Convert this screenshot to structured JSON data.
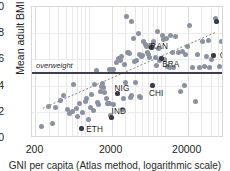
{
  "chart_data": {
    "type": "scatter",
    "title": "",
    "xlabel": "GNI per capita (Atlas method, logarithmic scale)",
    "ylabel": "Mean adult BMI",
    "xscale": "log",
    "xlim": [
      180,
      60000
    ],
    "ylim": [
      20,
      30
    ],
    "xticks": [
      200,
      2000,
      20000
    ],
    "xticklabels": [
      "200",
      "2000",
      "20000"
    ],
    "yticks": [
      20,
      22,
      24,
      26,
      28,
      30
    ],
    "yticklabels": [
      "20",
      "22",
      "24",
      "26",
      "28",
      "30"
    ],
    "grid": true,
    "legend": "none",
    "reference_lines": [
      {
        "name": "overweight",
        "label": "overweight",
        "orientation": "horizontal",
        "y": 25,
        "color": "#3d3d4d"
      }
    ],
    "trend_line": {
      "style": "dotted",
      "color": "#808080",
      "x_start": 250,
      "y_start": 22.15,
      "x_end": 50000,
      "y_end": 28.05
    },
    "labeled_points": [
      {
        "label": "USA",
        "x": 48000,
        "y": 28.9,
        "label_dx": 6,
        "label_dy": -7
      },
      {
        "label": "GER",
        "x": 44000,
        "y": 26.3,
        "label_dx": 6,
        "label_dy": -1
      },
      {
        "label": "IRAN",
        "x": 6600,
        "y": 26.9,
        "label_dx": -3,
        "label_dy": -2
      },
      {
        "label": "BRA",
        "x": 9000,
        "y": 26.1,
        "label_dx": 1,
        "label_dy": 6
      },
      {
        "label": "NIG",
        "x": 2400,
        "y": 23.4,
        "label_dx": -3,
        "label_dy": -6
      },
      {
        "label": "CHI",
        "x": 7000,
        "y": 24.0,
        "label_dx": -4,
        "label_dy": 7
      },
      {
        "label": "IND",
        "x": 2000,
        "y": 21.6,
        "label_dx": 0,
        "label_dy": -6
      },
      {
        "label": "ETH",
        "x": 800,
        "y": 20.7,
        "label_dx": 5,
        "label_dy": 0
      }
    ],
    "points": [
      {
        "x": 240,
        "y": 20.85
      },
      {
        "x": 330,
        "y": 21.1
      },
      {
        "x": 300,
        "y": 22.4
      },
      {
        "x": 370,
        "y": 22.35
      },
      {
        "x": 420,
        "y": 22.9
      },
      {
        "x": 470,
        "y": 23.25
      },
      {
        "x": 520,
        "y": 22.15
      },
      {
        "x": 560,
        "y": 21.9
      },
      {
        "x": 610,
        "y": 22.05
      },
      {
        "x": 640,
        "y": 24.1
      },
      {
        "x": 700,
        "y": 22.25
      },
      {
        "x": 720,
        "y": 21.65
      },
      {
        "x": 760,
        "y": 22.6
      },
      {
        "x": 800,
        "y": 20.7
      },
      {
        "x": 840,
        "y": 21.95
      },
      {
        "x": 900,
        "y": 22.8
      },
      {
        "x": 950,
        "y": 23.05
      },
      {
        "x": 980,
        "y": 21.45
      },
      {
        "x": 1050,
        "y": 22.35
      },
      {
        "x": 1100,
        "y": 23.35
      },
      {
        "x": 1150,
        "y": 22.1
      },
      {
        "x": 1200,
        "y": 24.05
      },
      {
        "x": 1250,
        "y": 25.15
      },
      {
        "x": 1300,
        "y": 22.7
      },
      {
        "x": 1350,
        "y": 22.55
      },
      {
        "x": 1420,
        "y": 23.55
      },
      {
        "x": 1500,
        "y": 24.15
      },
      {
        "x": 1550,
        "y": 23.85
      },
      {
        "x": 1600,
        "y": 23.45
      },
      {
        "x": 1700,
        "y": 23.05
      },
      {
        "x": 1750,
        "y": 22.65
      },
      {
        "x": 1800,
        "y": 22.6
      },
      {
        "x": 1900,
        "y": 22.6
      },
      {
        "x": 1950,
        "y": 21.7
      },
      {
        "x": 2000,
        "y": 21.6
      },
      {
        "x": 2100,
        "y": 22.55
      },
      {
        "x": 2150,
        "y": 25.25
      },
      {
        "x": 2300,
        "y": 25.8
      },
      {
        "x": 2400,
        "y": 23.4
      },
      {
        "x": 2500,
        "y": 26.05
      },
      {
        "x": 2600,
        "y": 25.95
      },
      {
        "x": 2700,
        "y": 26.2
      },
      {
        "x": 2800,
        "y": 22.15
      },
      {
        "x": 2900,
        "y": 23.05
      },
      {
        "x": 3000,
        "y": 25.6
      },
      {
        "x": 3100,
        "y": 29.25
      },
      {
        "x": 3200,
        "y": 26.5
      },
      {
        "x": 3300,
        "y": 26.55
      },
      {
        "x": 3400,
        "y": 26.45
      },
      {
        "x": 3500,
        "y": 23.1
      },
      {
        "x": 3600,
        "y": 23.25
      },
      {
        "x": 3700,
        "y": 28.9
      },
      {
        "x": 3900,
        "y": 27.6
      },
      {
        "x": 4000,
        "y": 25.85
      },
      {
        "x": 4100,
        "y": 24.2
      },
      {
        "x": 4300,
        "y": 25.9
      },
      {
        "x": 4500,
        "y": 27.95
      },
      {
        "x": 4700,
        "y": 26.4
      },
      {
        "x": 4900,
        "y": 26.25
      },
      {
        "x": 5100,
        "y": 26.3
      },
      {
        "x": 5300,
        "y": 27.35
      },
      {
        "x": 5500,
        "y": 27.1
      },
      {
        "x": 5700,
        "y": 26.95
      },
      {
        "x": 5900,
        "y": 26.55
      },
      {
        "x": 6100,
        "y": 26.35
      },
      {
        "x": 6300,
        "y": 26.15
      },
      {
        "x": 6600,
        "y": 26.9
      },
      {
        "x": 6800,
        "y": 27.15
      },
      {
        "x": 7000,
        "y": 24.0
      },
      {
        "x": 7200,
        "y": 27.35
      },
      {
        "x": 7500,
        "y": 26.15
      },
      {
        "x": 7800,
        "y": 25.5
      },
      {
        "x": 8000,
        "y": 28.15
      },
      {
        "x": 8300,
        "y": 26.85
      },
      {
        "x": 8600,
        "y": 25.95
      },
      {
        "x": 9000,
        "y": 26.1
      },
      {
        "x": 9300,
        "y": 27.85
      },
      {
        "x": 9600,
        "y": 27.5
      },
      {
        "x": 10000,
        "y": 26.0
      },
      {
        "x": 10500,
        "y": 27.6
      },
      {
        "x": 11000,
        "y": 25.45
      },
      {
        "x": 11500,
        "y": 25.4
      },
      {
        "x": 12000,
        "y": 27.8
      },
      {
        "x": 12500,
        "y": 26.55
      },
      {
        "x": 13000,
        "y": 25.4
      },
      {
        "x": 14000,
        "y": 27.75
      },
      {
        "x": 15000,
        "y": 26.55
      },
      {
        "x": 16000,
        "y": 23.55
      },
      {
        "x": 17000,
        "y": 26.6
      },
      {
        "x": 18000,
        "y": 24.0
      },
      {
        "x": 19000,
        "y": 26.4
      },
      {
        "x": 20000,
        "y": 26.95
      },
      {
        "x": 21000,
        "y": 28.55
      },
      {
        "x": 23000,
        "y": 25.4
      },
      {
        "x": 25000,
        "y": 22.75
      },
      {
        "x": 27000,
        "y": 26.35
      },
      {
        "x": 29000,
        "y": 25.35
      },
      {
        "x": 31000,
        "y": 27.35
      },
      {
        "x": 33000,
        "y": 25.45
      },
      {
        "x": 35000,
        "y": 26.25
      },
      {
        "x": 37000,
        "y": 27.45
      },
      {
        "x": 39000,
        "y": 25.4
      },
      {
        "x": 41000,
        "y": 26.0
      },
      {
        "x": 44000,
        "y": 26.3
      },
      {
        "x": 46000,
        "y": 29.15
      },
      {
        "x": 48000,
        "y": 28.9
      },
      {
        "x": 52000,
        "y": 25.45
      },
      {
        "x": 55000,
        "y": 27.35
      },
      {
        "x": 2050,
        "y": 25.25
      },
      {
        "x": 1850,
        "y": 25.2
      },
      {
        "x": 1480,
        "y": 23.9
      },
      {
        "x": 3050,
        "y": 24.2
      },
      {
        "x": 4600,
        "y": 23.15
      },
      {
        "x": 4800,
        "y": 23.1
      }
    ]
  },
  "axis": {
    "ylabel": "Mean adult BMI",
    "xtitle": "GNI per capita (Atlas method, logarithmic scale)"
  }
}
